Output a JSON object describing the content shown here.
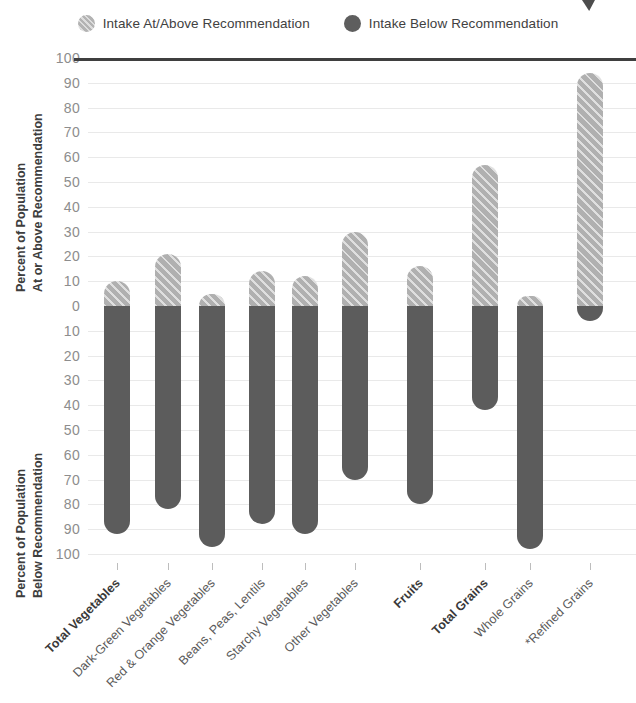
{
  "legend": {
    "items": [
      {
        "label": "Intake At/Above Recommendation",
        "swatch": "light-hatched-circle-icon",
        "color": "#b3b3b3"
      },
      {
        "label": "Intake Below Recommendation",
        "swatch": "dark-circle-icon",
        "color": "#5e5e5e"
      }
    ]
  },
  "axes": {
    "upper_title_line1": "Percent of Population",
    "upper_title_line2": "At or Above Recommendation",
    "lower_title_line1": "Percent of Population",
    "lower_title_line2": "Below Recommendation",
    "upper_ticks": [
      "100",
      "90",
      "80",
      "70",
      "60",
      "50",
      "40",
      "30",
      "20",
      "10",
      "0"
    ],
    "lower_ticks": [
      "10",
      "20",
      "30",
      "40",
      "50",
      "60",
      "70",
      "80",
      "90",
      "100"
    ]
  },
  "chart_data": {
    "type": "bar",
    "title": "",
    "xlabel": "",
    "ylabel": "Percent of Population",
    "ylim": [
      -100,
      100
    ],
    "grid": true,
    "legend_position": "top-center",
    "orientation": "vertical-diverging",
    "categories": [
      "Total Vegetables",
      "Dark-Green Vegetables",
      "Red & Orange Vegetables",
      "Beans, Peas, Lentils",
      "Starchy Vegetables",
      "Other Vegetables",
      "Fruits",
      "Total Grains",
      "Whole Grains",
      "*Refined Grains"
    ],
    "category_emphasis": [
      true,
      false,
      false,
      false,
      false,
      false,
      true,
      true,
      false,
      false
    ],
    "series": [
      {
        "name": "Intake At/Above Recommendation",
        "color": "#b0b0b0",
        "pattern": "diagonal-hatch",
        "values": [
          10,
          21,
          5,
          14,
          12,
          30,
          16,
          57,
          2,
          94
        ]
      },
      {
        "name": "Intake Below Recommendation",
        "color": "#5c5c5c",
        "pattern": "solid",
        "values": [
          92,
          82,
          97,
          88,
          92,
          70,
          80,
          42,
          98,
          6
        ]
      }
    ]
  }
}
